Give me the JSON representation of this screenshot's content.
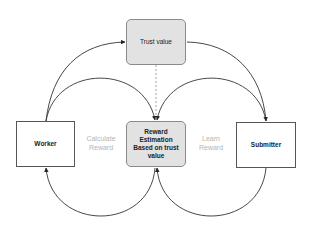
{
  "diagram": {
    "nodes": {
      "trust_value": {
        "label": "Trust value"
      },
      "worker": {
        "label": "Worker"
      },
      "reward_estimation": {
        "label": "Reward Estimation Based on trust value"
      },
      "submitter": {
        "label": "Submitter"
      }
    },
    "edge_labels": {
      "calculate_reward": "Calculate Reward",
      "learn_reward": "Learn Reward"
    },
    "edges": [
      {
        "from": "worker",
        "to": "trust_value",
        "style": "solid",
        "arrow": "end"
      },
      {
        "from": "trust_value",
        "to": "submitter",
        "style": "solid",
        "arrow": "end"
      },
      {
        "from": "worker",
        "to": "reward_estimation",
        "style": "solid",
        "arrow": "end"
      },
      {
        "from": "submitter",
        "to": "reward_estimation",
        "style": "solid",
        "arrow": "end"
      },
      {
        "from": "trust_value",
        "to": "reward_estimation",
        "style": "dashed",
        "arrow": "none"
      },
      {
        "from": "reward_estimation",
        "to": "worker",
        "style": "solid",
        "arrow": "end"
      },
      {
        "from": "submitter",
        "to": "reward_estimation",
        "style": "solid",
        "arrow": "end",
        "side": "bottom"
      }
    ],
    "colors": {
      "shaded_fill": "#e2e2e2",
      "edge_stroke": "#333333",
      "dashed_stroke": "#9a9a9a",
      "edge_label_text": "#b5b5b5"
    }
  }
}
